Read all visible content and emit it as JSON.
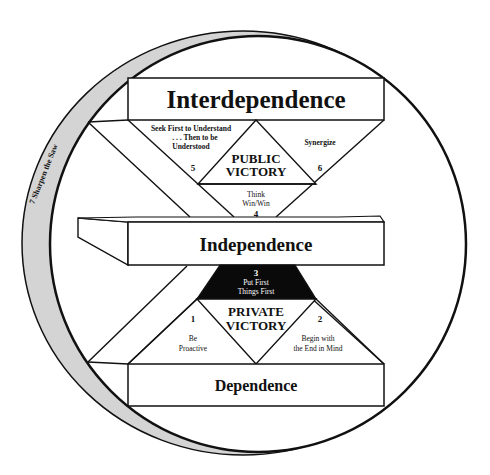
{
  "diagram": {
    "ring_label": "7 Sharpen the Saw",
    "levels": {
      "interdependence": "Interdependence",
      "independence": "Independence",
      "dependence": "Dependence"
    },
    "public_victory": {
      "line1": "PUBLIC",
      "line2": "VICTORY"
    },
    "private_victory": {
      "line1": "PRIVATE",
      "line2": "VICTORY"
    },
    "habits": {
      "h1": {
        "number": "1",
        "line1": "Be",
        "line2": "Proactive"
      },
      "h2": {
        "number": "2",
        "line1": "Begin with",
        "line2": "the End in Mind"
      },
      "h3": {
        "number": "3",
        "line1": "Put First",
        "line2": "Things First"
      },
      "h4": {
        "number": "4",
        "line1": "Think",
        "line2": "Win/Win"
      },
      "h5": {
        "number": "5",
        "line1": "Seek First to Understand",
        "line2": ". . . Then to be",
        "line3": "Understood"
      },
      "h6": {
        "number": "6",
        "line1": "Synergize"
      }
    },
    "colors": {
      "ring_fill": "#d4d4d4",
      "stroke": "#111111",
      "dark_triangle": "#0a0a0a",
      "background": "#ffffff"
    }
  }
}
